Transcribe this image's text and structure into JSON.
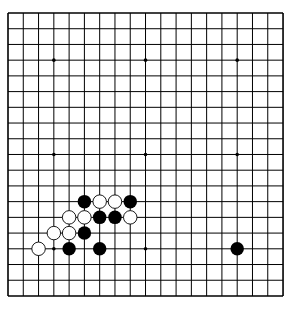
{
  "board": {
    "size": 19,
    "origin_x": 8,
    "origin_y": 13,
    "step_x": 15.28,
    "step_y": 15.72,
    "line_color": "#000000",
    "background": "#ffffff",
    "hoshi": [
      [
        3,
        3
      ],
      [
        9,
        3
      ],
      [
        15,
        3
      ],
      [
        3,
        9
      ],
      [
        9,
        9
      ],
      [
        15,
        9
      ],
      [
        3,
        15
      ],
      [
        9,
        15
      ],
      [
        15,
        15
      ]
    ],
    "stones": [
      {
        "color": "black",
        "col": 5,
        "row": 12
      },
      {
        "color": "white",
        "col": 6,
        "row": 12
      },
      {
        "color": "white",
        "col": 7,
        "row": 12
      },
      {
        "color": "black",
        "col": 8,
        "row": 12
      },
      {
        "color": "white",
        "col": 4,
        "row": 13
      },
      {
        "color": "white",
        "col": 5,
        "row": 13
      },
      {
        "color": "black",
        "col": 6,
        "row": 13
      },
      {
        "color": "black",
        "col": 7,
        "row": 13
      },
      {
        "color": "white",
        "col": 8,
        "row": 13
      },
      {
        "color": "white",
        "col": 3,
        "row": 14
      },
      {
        "color": "white",
        "col": 4,
        "row": 14
      },
      {
        "color": "black",
        "col": 5,
        "row": 14
      },
      {
        "color": "white",
        "col": 2,
        "row": 15
      },
      {
        "color": "black",
        "col": 4,
        "row": 15
      },
      {
        "color": "black",
        "col": 6,
        "row": 15
      },
      {
        "color": "black",
        "col": 15,
        "row": 15
      }
    ]
  }
}
